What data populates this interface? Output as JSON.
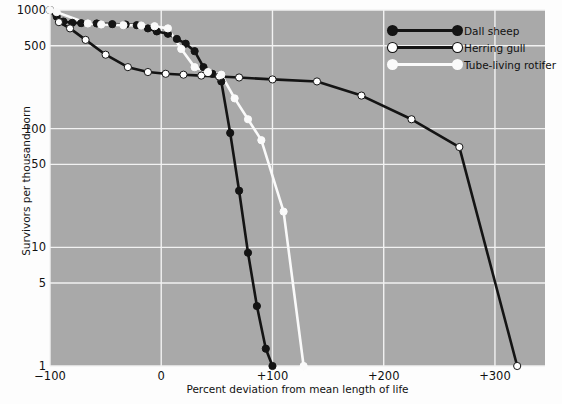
{
  "chart_data": {
    "type": "line",
    "title": "",
    "xlabel": "Percent deviation from mean length of life",
    "ylabel": "Survivors per thousand born",
    "xlim": [
      -100,
      345
    ],
    "ylim": [
      1,
      1000
    ],
    "yscale": "log",
    "grid": true,
    "legend_position": "top-right",
    "xticks": [
      -100,
      0,
      100,
      200,
      300
    ],
    "xtick_labels": [
      "−100",
      "0",
      "+100",
      "+200",
      "+300"
    ],
    "yticks": [
      1000,
      500,
      100,
      50,
      10,
      5,
      1
    ],
    "ytick_labels": [
      "1000",
      "500",
      "100",
      "50",
      "10",
      "5",
      "1"
    ],
    "background_color": "#a9a9a9",
    "gridline_color": "#f2f2f2",
    "series": [
      {
        "name": "Dall sheep",
        "line_color": "#141414",
        "marker_color": "#141414",
        "marker_edge": "#141414",
        "x": [
          -100,
          -94,
          -88,
          -80,
          -72,
          -58,
          -44,
          -32,
          -22,
          -12,
          -4,
          6,
          14,
          22,
          30,
          38,
          46,
          54,
          62,
          70,
          78,
          86,
          94,
          100
        ],
        "y": [
          1000,
          880,
          800,
          780,
          775,
          770,
          760,
          755,
          745,
          700,
          660,
          630,
          570,
          520,
          450,
          330,
          290,
          250,
          92,
          30,
          9,
          3.2,
          1.4,
          1
        ]
      },
      {
        "name": "Herring gull",
        "line_color": "#141414",
        "marker_color": "#ffffff",
        "marker_edge": "#141414",
        "x": [
          -100,
          -92,
          -82,
          -68,
          -50,
          -30,
          -12,
          4,
          20,
          36,
          52,
          70,
          100,
          140,
          180,
          225,
          268,
          320
        ],
        "y": [
          1000,
          790,
          700,
          560,
          420,
          330,
          300,
          290,
          285,
          280,
          275,
          270,
          260,
          250,
          190,
          120,
          70,
          1
        ]
      },
      {
        "name": "Tube-living rotifer",
        "line_color": "#fafafa",
        "marker_color": "#fafafa",
        "marker_edge": "#fafafa",
        "x": [
          -100,
          -94,
          -66,
          -54,
          -34,
          -18,
          -6,
          6,
          18,
          30,
          42,
          54,
          66,
          78,
          90,
          110,
          128
        ],
        "y": [
          1000,
          960,
          770,
          755,
          745,
          740,
          730,
          700,
          470,
          330,
          300,
          285,
          180,
          120,
          80,
          20,
          1
        ]
      }
    ]
  },
  "axes": {
    "ylabel": "Survivors per thousand born",
    "xlabel": "Percent deviation from mean length of life"
  },
  "legend": {
    "items": [
      {
        "label": "Dall sheep",
        "line": "#141414",
        "dot": "#141414",
        "dot_edge": "#141414"
      },
      {
        "label": "Herring gull",
        "line": "#141414",
        "dot": "#ffffff",
        "dot_edge": "#141414"
      },
      {
        "label": "Tube-living rotifer",
        "line": "#fafafa",
        "dot": "#fafafa",
        "dot_edge": "#fafafa"
      }
    ]
  }
}
